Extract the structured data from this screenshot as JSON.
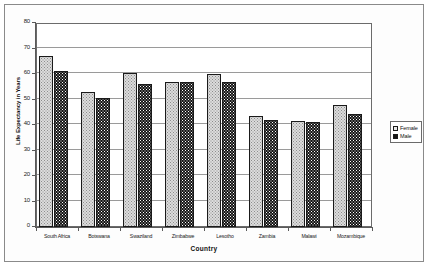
{
  "chart_data": {
    "type": "bar",
    "title": "",
    "xlabel": "Country",
    "ylabel": "Life Expectancy in Years",
    "ylim": [
      0,
      80
    ],
    "yticks": [
      0,
      10,
      20,
      30,
      40,
      50,
      60,
      70,
      80
    ],
    "grid": true,
    "legend_position": "right",
    "categories": [
      "South Africa",
      "Botswana",
      "Swaziland",
      "Zimbabwe",
      "Lesotho",
      "Zambia",
      "Malawi",
      "Mozambique"
    ],
    "series": [
      {
        "name": "Female",
        "color": "#dcdcdc",
        "values": [
          67,
          53,
          60.5,
          57,
          60,
          43.5,
          41.5,
          48
        ]
      },
      {
        "name": "Male",
        "color": "#141414",
        "values": [
          61,
          50.5,
          56,
          57,
          57,
          42,
          41,
          44.5
        ]
      }
    ]
  },
  "legend": {
    "items": [
      {
        "label": "Female",
        "swatch": "female-swatch-icon"
      },
      {
        "label": "Male",
        "swatch": "male-swatch-icon"
      }
    ]
  }
}
